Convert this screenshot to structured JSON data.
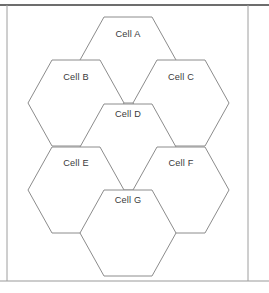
{
  "figure": {
    "canvas": {
      "width": 269,
      "height": 293
    },
    "background_color": "#ffffff",
    "frame": {
      "top_rule_color": "#3c3c3c",
      "bottom_rule_color": "#9a9a9a",
      "side_line_color": "#9e9e9e",
      "top_rule_y": 5,
      "bottom_rule_y": 281,
      "left_x": 7,
      "right_x": 248
    },
    "hexagon_style": {
      "stroke_color": "#8c8c8c",
      "fill_color": "#ffffff",
      "stroke_width": 1,
      "orientation": "flat-top",
      "width": 96,
      "height": 86
    },
    "label_color": "#3a3a3a"
  },
  "chart_data": {
    "type": "diagram",
    "subtitle": "",
    "xlabel": "",
    "ylabel": "",
    "grid": false,
    "legend": "none",
    "cells": [
      {
        "id": "A",
        "label": "Cell A",
        "cx": 128,
        "cy": 60,
        "label_y": 37,
        "row": "top",
        "column": "center"
      },
      {
        "id": "B",
        "label": "Cell B",
        "cx": 76,
        "cy": 103,
        "label_y": 80,
        "row": "upper",
        "column": "left"
      },
      {
        "id": "C",
        "label": "Cell C",
        "cx": 181,
        "cy": 103,
        "label_y": 80,
        "row": "upper",
        "column": "right"
      },
      {
        "id": "D",
        "label": "Cell D",
        "cx": 128,
        "cy": 147,
        "label_y": 117,
        "row": "middle",
        "column": "center"
      },
      {
        "id": "E",
        "label": "Cell E",
        "cx": 76,
        "cy": 190,
        "label_y": 166,
        "row": "lower",
        "column": "left"
      },
      {
        "id": "F",
        "label": "Cell F",
        "cx": 181,
        "cy": 190,
        "label_y": 166,
        "row": "lower",
        "column": "right"
      },
      {
        "id": "G",
        "label": "Cell G",
        "cx": 128,
        "cy": 233,
        "label_y": 203,
        "row": "bottom",
        "column": "center"
      }
    ]
  }
}
